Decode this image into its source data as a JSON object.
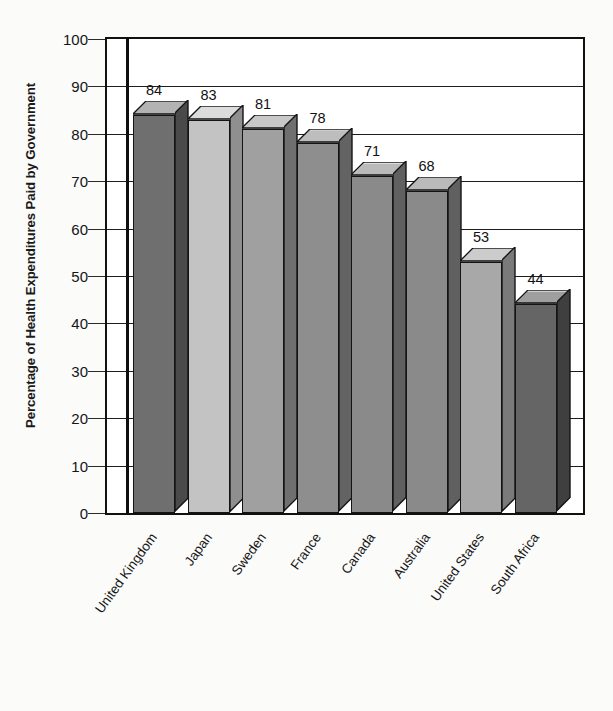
{
  "chart_data": {
    "type": "bar",
    "title": "",
    "xlabel": "",
    "ylabel": "Percentage of Health Expenditures Paid by Government",
    "categories": [
      "United Kingdom",
      "Japan",
      "Sweden",
      "France",
      "Canada",
      "Australia",
      "United States",
      "South Africa"
    ],
    "values": [
      84,
      83,
      81,
      78,
      71,
      68,
      53,
      44
    ],
    "ylim": [
      0,
      100
    ],
    "yticks": [
      0,
      10,
      20,
      30,
      40,
      50,
      60,
      70,
      80,
      90,
      100
    ],
    "ytick_labels": [
      "0",
      "10",
      "20",
      "30",
      "40",
      "50",
      "60",
      "70",
      "80",
      "90",
      "100"
    ],
    "grid": true,
    "legend": "none",
    "data_labels": [
      "84",
      "83",
      "81",
      "78",
      "71",
      "68",
      "53",
      "44"
    ],
    "bar_style": "3d-column",
    "bar_colors": [
      "#6f6f6f",
      "#c3c3c3",
      "#a0a0a0",
      "#8e8e8e",
      "#8a8a8a",
      "#8a8a8a",
      "#a8a8a8",
      "#656565"
    ],
    "bar_top_colors": [
      "#b3b3b3",
      "#dcdcdc",
      "#c8c8c8",
      "#bdbdbd",
      "#bababa",
      "#bababa",
      "#cccccc",
      "#9f9f9f"
    ],
    "bar_side_colors": [
      "#4a4a4a",
      "#8f8f8f",
      "#6f6f6f",
      "#636363",
      "#606060",
      "#606060",
      "#7a7a7a",
      "#3f3f3f"
    ],
    "axis_color": "#111111",
    "background_color": "#ffffff"
  }
}
